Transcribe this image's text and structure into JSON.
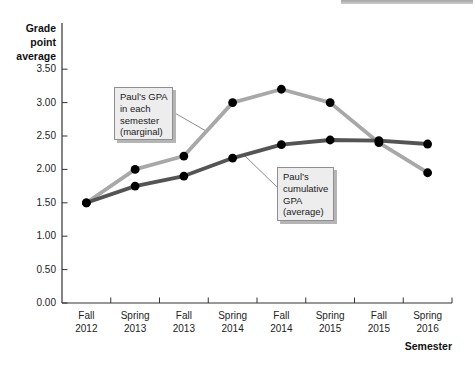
{
  "figure": {
    "y_axis_title": "Grade\npoint\naverage",
    "x_axis_title": "Semester",
    "callouts": {
      "marginal": "Paul’s GPA\nin each\nsemester\n(marginal)",
      "average": "Paul’s\ncumulative\nGPA\n(average)"
    }
  },
  "chart_data": {
    "type": "line",
    "title": "",
    "xlabel": "Semester",
    "ylabel": "Grade point average",
    "categories": [
      "Fall\n2012",
      "Spring\n2013",
      "Fall\n2013",
      "Spring\n2014",
      "Fall\n2014",
      "Spring\n2015",
      "Fall\n2015",
      "Spring\n2016"
    ],
    "series": [
      {
        "name": "Paul’s GPA in each semester (marginal)",
        "color": "#a8a8a8",
        "values": [
          1.5,
          2.0,
          2.2,
          3.0,
          3.2,
          3.0,
          2.4,
          1.95
        ]
      },
      {
        "name": "Paul’s cumulative GPA (average)",
        "color": "#545454",
        "values": [
          1.5,
          1.75,
          1.9,
          2.17,
          2.37,
          2.44,
          2.43,
          2.38
        ]
      }
    ],
    "ylim": [
      0,
      3.5
    ],
    "ytick_labels": [
      "0.00",
      "0.50",
      "1.00",
      "1.50",
      "2.00",
      "2.50",
      "3.00",
      "3.50"
    ],
    "grid": false,
    "legend_position": "callout annotations on plot",
    "marker": "filled black circle",
    "point_color": "#000000",
    "axis_color": "#333333",
    "connector_color": "#8c8c8c"
  }
}
